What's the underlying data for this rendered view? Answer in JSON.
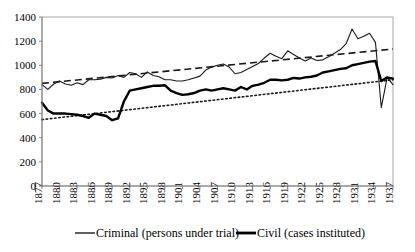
{
  "chart_data": {
    "type": "line",
    "title": "",
    "subtitle": "",
    "xlabel": "",
    "ylabel": "",
    "xlim": [
      1877,
      1937
    ],
    "ylim": [
      0,
      1400
    ],
    "ytick_step": 200,
    "yticks": [
      0,
      200,
      400,
      600,
      800,
      1000,
      1200,
      1400
    ],
    "xticks": [
      1877,
      1880,
      1883,
      1886,
      1889,
      1892,
      1895,
      1898,
      1901,
      1904,
      1907,
      1910,
      1913,
      1916,
      1919,
      1922,
      1925,
      1928,
      1931,
      1934,
      1937
    ],
    "grid": false,
    "legend_position": "bottom",
    "x": [
      1877,
      1878,
      1879,
      1880,
      1881,
      1882,
      1883,
      1884,
      1885,
      1886,
      1887,
      1888,
      1889,
      1890,
      1891,
      1892,
      1893,
      1894,
      1895,
      1896,
      1897,
      1898,
      1899,
      1900,
      1901,
      1902,
      1903,
      1904,
      1905,
      1906,
      1907,
      1908,
      1909,
      1910,
      1911,
      1912,
      1913,
      1914,
      1915,
      1916,
      1917,
      1918,
      1919,
      1920,
      1921,
      1922,
      1923,
      1924,
      1925,
      1926,
      1927,
      1928,
      1929,
      1930,
      1931,
      1932,
      1933,
      1934,
      1935,
      1936,
      1937
    ],
    "series": [
      {
        "name": "Criminal (persons under trial)",
        "style": "thin-solid",
        "values": [
          840,
          800,
          845,
          870,
          845,
          835,
          855,
          840,
          880,
          880,
          885,
          900,
          895,
          915,
          900,
          940,
          930,
          900,
          945,
          915,
          905,
          880,
          880,
          870,
          870,
          880,
          895,
          910,
          960,
          985,
          1000,
          1010,
          985,
          930,
          940,
          965,
          990,
          1015,
          1060,
          1100,
          1075,
          1055,
          1120,
          1090,
          1060,
          1035,
          1060,
          1040,
          1045,
          1070,
          1100,
          1130,
          1180,
          1300,
          1220,
          1240,
          1265,
          1190,
          650,
          900,
          840
        ]
      },
      {
        "name": "Civil (cases instituted)",
        "style": "thick-solid",
        "values": [
          690,
          625,
          600,
          600,
          600,
          595,
          590,
          580,
          565,
          600,
          590,
          580,
          545,
          560,
          700,
          790,
          800,
          810,
          820,
          830,
          830,
          835,
          790,
          770,
          755,
          760,
          770,
          790,
          800,
          790,
          800,
          810,
          800,
          790,
          820,
          800,
          830,
          840,
          855,
          880,
          880,
          875,
          880,
          895,
          890,
          900,
          905,
          915,
          940,
          950,
          960,
          970,
          975,
          1000,
          1010,
          1020,
          1030,
          1035,
          870,
          900,
          890
        ]
      }
    ],
    "trendlines": [
      {
        "name": "Criminal trend",
        "style": "dashed",
        "x": [
          1877,
          1937
        ],
        "values": [
          850,
          1135
        ]
      },
      {
        "name": "Civil trend",
        "style": "dotted",
        "x": [
          1877,
          1937
        ],
        "values": [
          550,
          880
        ]
      }
    ],
    "legend": [
      {
        "label": "Criminal (persons under trial)",
        "style": "thin-solid"
      },
      {
        "label": "Civil (cases instituted)",
        "style": "thick-solid"
      }
    ]
  },
  "colors": {
    "series_criminal": "#1a1a1a",
    "series_civil": "#000000",
    "axis": "#808080",
    "frame": "#a8a8a8",
    "background": "#ffffff"
  }
}
